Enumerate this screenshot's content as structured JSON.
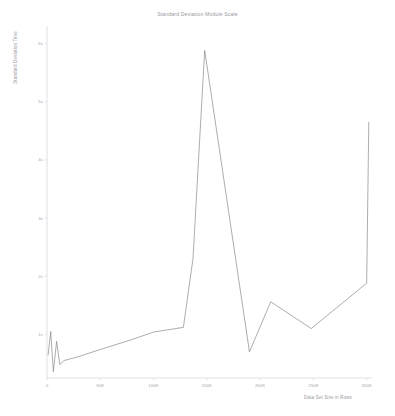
{
  "figure": {
    "background": "#ffffff",
    "line_color": "#7a7a80",
    "axis_color": "#cfcfd4",
    "text_color": "#9b9b9f"
  },
  "top_ghost": {
    "fragment_left": "·",
    "fragment_mid": "·",
    "fragment_right": "·"
  },
  "chart_data": {
    "type": "line",
    "title": "Standard Deviation Module Scale",
    "xlabel": "Data Set Size in Rows",
    "ylabel": "Standard Deviation Time",
    "xlim": [
      0,
      305000
    ],
    "ylim": [
      0.25,
      6.3
    ],
    "grid": false,
    "legend": false,
    "xticks": [
      0,
      50000,
      100000,
      150000,
      200000,
      250000,
      300000
    ],
    "xticklabels": [
      "0",
      "50K",
      "100K",
      "150K",
      "200K",
      "250K",
      "300K"
    ],
    "yticks": [
      1,
      2,
      3,
      4,
      5,
      6
    ],
    "yticklabels": [
      "1s",
      "2s",
      "3s",
      "4s",
      "5s",
      "6s"
    ],
    "series": [
      {
        "name": "Standard Deviation Time",
        "x": [
          1000,
          3500,
          6000,
          9000,
          12000,
          16000,
          30000,
          50000,
          78000,
          100000,
          128000,
          137000,
          148000,
          190000,
          210000,
          248000,
          300000,
          302000
        ],
        "y": [
          0.64,
          1.05,
          0.36,
          0.88,
          0.48,
          0.55,
          0.62,
          0.74,
          0.9,
          1.04,
          1.12,
          2.3,
          5.88,
          0.7,
          1.56,
          1.1,
          1.88,
          4.65
        ]
      }
    ]
  }
}
